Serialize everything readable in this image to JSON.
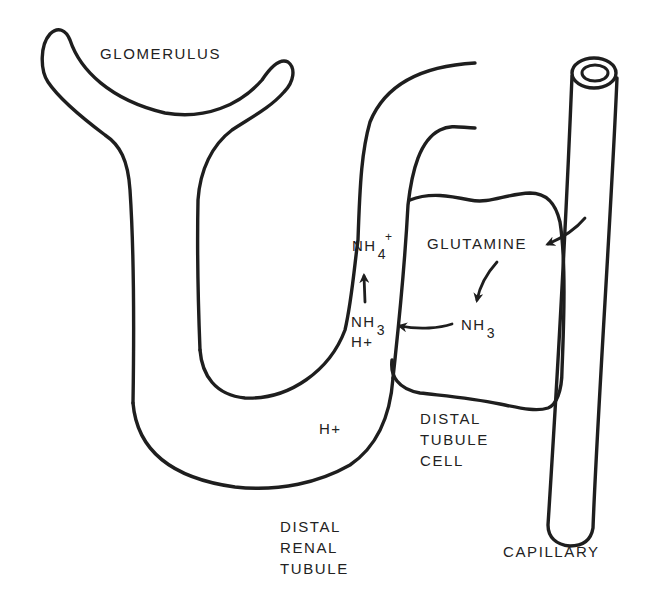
{
  "diagram": {
    "type": "physiology-schematic",
    "colors": {
      "background": "#ffffff",
      "ink": "#1e1e1e"
    },
    "structures": {
      "glomerulus": {
        "label": "GLOMERULUS"
      },
      "tubule": {
        "label_lines": [
          "DISTAL",
          "RENAL",
          "TUBULE"
        ]
      },
      "cell": {
        "label_lines": [
          "DISTAL",
          "TUBULE",
          "CELL"
        ]
      },
      "capillary": {
        "label": "CAPILLARY"
      }
    },
    "molecules": {
      "glutamine": "GLUTAMINE",
      "nh3_cell": {
        "base": "NH",
        "sub": "3"
      },
      "nh3_lumen": {
        "base": "NH",
        "sub": "3"
      },
      "h_lumen_upper": "H+",
      "h_lumen_lower": "H+",
      "nh4": {
        "base": "NH",
        "sub": "4",
        "sup": "+"
      }
    },
    "arrows": [
      {
        "from": "capillary",
        "to": "GLUTAMINE",
        "icon": "curved-arrow-icon"
      },
      {
        "from": "GLUTAMINE",
        "to": "NH3 (cell)",
        "icon": "curved-arrow-icon"
      },
      {
        "from": "NH3 (cell)",
        "to": "NH3 (lumen)",
        "icon": "arrow-left-icon"
      },
      {
        "from": "NH3 + H+",
        "to": "NH4+",
        "icon": "arrow-up-icon"
      }
    ]
  }
}
